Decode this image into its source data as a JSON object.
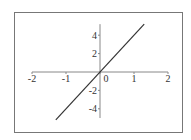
{
  "chart_data": {
    "type": "line",
    "title": "",
    "xlabel": "",
    "ylabel": "",
    "xlim": [
      -2,
      2
    ],
    "ylim": [
      -5.2,
      5.2
    ],
    "grid": false,
    "legend": null,
    "x_ticks": [
      -2,
      -1,
      0,
      1,
      2
    ],
    "x_tick_labels": [
      "-2",
      "-1",
      "0",
      "1",
      "2"
    ],
    "y_ticks": [
      -4,
      -2,
      2,
      4
    ],
    "y_tick_labels": [
      "-4",
      "-2",
      "2",
      "4"
    ],
    "series": [
      {
        "name": "y = 4x",
        "x": [
          -1.3,
          1.3
        ],
        "y": [
          -5.2,
          5.2
        ]
      }
    ]
  },
  "colors": {
    "line": "#333333",
    "axis": "#888888",
    "frame": "#666666"
  }
}
